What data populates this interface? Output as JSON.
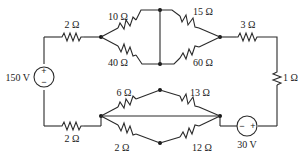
{
  "diagram": {
    "type": "circuit",
    "sources": [
      {
        "id": "V1",
        "value": "150 V",
        "polarity": {
          "top": "+",
          "bottom": "−"
        }
      },
      {
        "id": "V2",
        "value": "30 V",
        "polarity": {
          "left": "−",
          "right": "+"
        }
      }
    ],
    "resistors": {
      "top_left": "2 Ω",
      "bottom_left": "2 Ω",
      "upper_a": "10 Ω",
      "upper_b": "40 Ω",
      "upper_c": "15 Ω",
      "upper_d": "60 Ω",
      "right_top": "3 Ω",
      "right_vertical": "1 Ω",
      "lower_a": "6 Ω",
      "lower_b": "13 Ω",
      "lower_c": "2 Ω",
      "lower_d": "12 Ω"
    }
  }
}
